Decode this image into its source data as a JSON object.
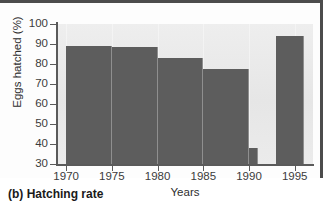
{
  "figure": {
    "caption": "(b) Hatching rate",
    "panel_color": "#e9e9e9",
    "bar_color": "#5d5d5d",
    "axis_color": "#5a5a5a",
    "frame_color": "#4c4c4c"
  },
  "chart_data": {
    "type": "bar",
    "title": "(b) Hatching rate",
    "xlabel": "Years",
    "ylabel": "Eggs hatched (%)",
    "xlim": [
      1969,
      1997
    ],
    "ylim": [
      30,
      100
    ],
    "yticks": [
      30,
      40,
      50,
      60,
      70,
      80,
      90,
      100
    ],
    "xticks": [
      1970,
      1975,
      1980,
      1985,
      1990,
      1995
    ],
    "grid": "faint-vertical",
    "legend": "none",
    "categories": [
      "1970-1975",
      "1975-1980",
      "1980-1985",
      "1985-1990",
      "1990-1991",
      "1993-1996"
    ],
    "values": [
      89,
      88.5,
      83,
      77.5,
      38,
      94
    ],
    "bars": [
      {
        "label": "1970-1975",
        "x_start": 1970,
        "x_end": 1975,
        "value": 89
      },
      {
        "label": "1975-1980",
        "x_start": 1975,
        "x_end": 1980,
        "value": 88.5
      },
      {
        "label": "1980-1985",
        "x_start": 1980,
        "x_end": 1985,
        "value": 83
      },
      {
        "label": "1985-1990",
        "x_start": 1985,
        "x_end": 1990,
        "value": 77.5
      },
      {
        "label": "1990-1991",
        "x_start": 1990,
        "x_end": 1991,
        "value": 38
      },
      {
        "label": "1993-1996",
        "x_start": 1993,
        "x_end": 1996,
        "value": 94
      }
    ]
  }
}
